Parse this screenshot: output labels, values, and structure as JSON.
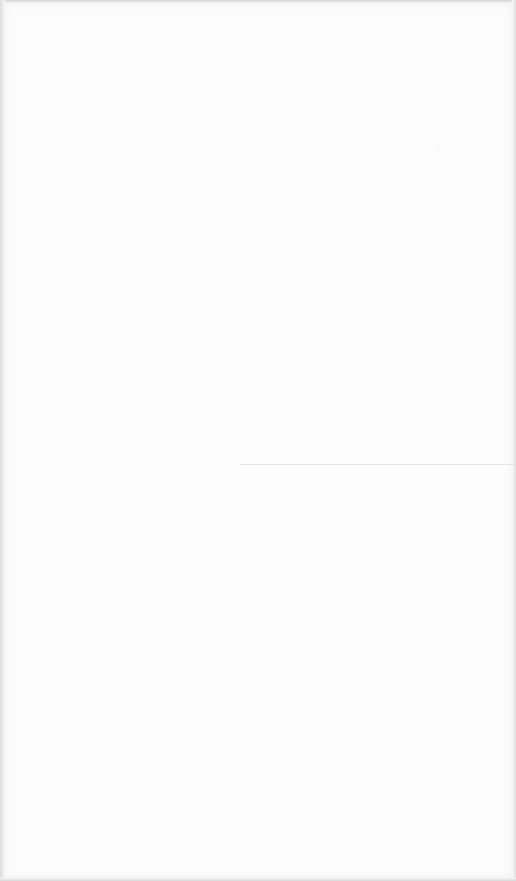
{
  "screen": {
    "background_color": "#fcfcfc",
    "border_color": "#e2e2e2",
    "content": "blank"
  },
  "divider": {
    "color": "#e6e6e6",
    "left": 240,
    "top": 464,
    "width": 276
  }
}
